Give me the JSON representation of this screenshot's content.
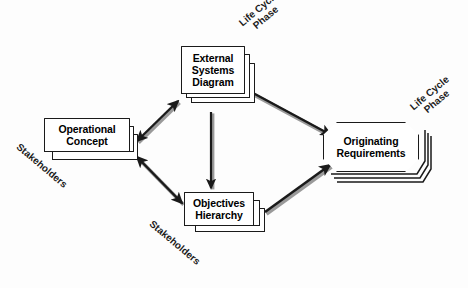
{
  "diagram": {
    "title_visible": false,
    "background_color": "#fdfdfd",
    "stroke_color": "#1a1a1a",
    "nodes": [
      {
        "id": "operational-concept",
        "kind": "stacked-rectangle",
        "lines": [
          "Operational",
          "Concept"
        ],
        "stack_count": 3
      },
      {
        "id": "external-systems-diagram",
        "kind": "stacked-rectangle",
        "lines": [
          "External",
          "Systems",
          "Diagram"
        ],
        "stack_count": 3
      },
      {
        "id": "objectives-hierarchy",
        "kind": "stacked-rectangle",
        "lines": [
          "Objectives",
          "Hierarchy"
        ],
        "stack_count": 3
      },
      {
        "id": "originating-requirements",
        "kind": "stacked-octagon",
        "lines": [
          "Originating",
          "Requirements"
        ],
        "stack_count": 4
      }
    ],
    "annotations": [
      {
        "id": "life-cycle-phase-top",
        "lines": [
          "Life Cycle",
          "Phase"
        ],
        "rotation_deg": -40
      },
      {
        "id": "life-cycle-phase-right",
        "lines": [
          "Life Cycle",
          "Phase"
        ],
        "rotation_deg": -40
      },
      {
        "id": "stakeholders-left",
        "lines": [
          "Stakeholders"
        ],
        "rotation_deg": 40
      },
      {
        "id": "stakeholders-bottom",
        "lines": [
          "Stakeholders"
        ],
        "rotation_deg": 40
      }
    ],
    "edges": [
      {
        "id": "edge-oc-to-esd",
        "from": "operational-concept",
        "to": "external-systems-diagram",
        "arrowheads": "both"
      },
      {
        "id": "edge-oc-to-oh",
        "from": "operational-concept",
        "to": "objectives-hierarchy",
        "arrowheads": "both"
      },
      {
        "id": "edge-esd-to-oh",
        "from": "external-systems-diagram",
        "to": "objectives-hierarchy",
        "arrowheads": "end"
      },
      {
        "id": "edge-esd-to-or",
        "from": "external-systems-diagram",
        "to": "originating-requirements",
        "arrowheads": "end"
      },
      {
        "id": "edge-oh-to-or",
        "from": "objectives-hierarchy",
        "to": "originating-requirements",
        "arrowheads": "end"
      }
    ]
  },
  "labels": {
    "operational_concept": {
      "line1": "Operational",
      "line2": "Concept"
    },
    "external_systems_diagram": {
      "line1": "External",
      "line2": "Systems",
      "line3": "Diagram"
    },
    "objectives_hierarchy": {
      "line1": "Objectives",
      "line2": "Hierarchy"
    },
    "originating_requirements": {
      "line1": "Originating",
      "line2": "Requirements"
    },
    "life_cycle_phase": {
      "line1": "Life Cycle",
      "line2": "Phase"
    },
    "stakeholders": {
      "text": "Stakeholders"
    }
  }
}
